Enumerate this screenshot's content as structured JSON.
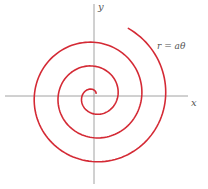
{
  "diagram": {
    "equation_label": "r = aθ",
    "axes": {
      "x_label": "x",
      "y_label": "y",
      "origin_px": [
        94,
        96
      ],
      "x_axis_px": [
        5,
        188
      ],
      "y_axis_px": [
        4,
        184
      ],
      "axis_color": "#8a8a8a"
    },
    "spiral": {
      "color": "#d42a35",
      "a_px_per_rad": 3.8,
      "theta_start": 0.9,
      "theta_end": 19.98,
      "direction": "counterclockwise"
    }
  }
}
